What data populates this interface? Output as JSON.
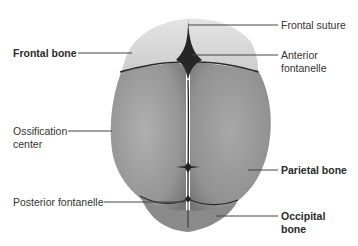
{
  "figure": {
    "labels": [
      {
        "id": "frontal-suture",
        "text": "Frontal suture",
        "bold": false
      },
      {
        "id": "frontal-bone",
        "text": "Frontal bone",
        "bold": true
      },
      {
        "id": "anterior-fontanelle-1",
        "text": "Anterior",
        "bold": false
      },
      {
        "id": "anterior-fontanelle-2",
        "text": "fontanelle",
        "bold": false
      },
      {
        "id": "ossification-center-1",
        "text": "Ossification",
        "bold": false
      },
      {
        "id": "ossification-center-2",
        "text": "center",
        "bold": false
      },
      {
        "id": "parietal-bone",
        "text": "Parietal bone",
        "bold": true
      },
      {
        "id": "posterior-fontanelle",
        "text": "Posterior fontanelle",
        "bold": false
      },
      {
        "id": "occipital-bone-1",
        "text": "Occipital",
        "bold": true
      },
      {
        "id": "occipital-bone-2",
        "text": "bone",
        "bold": true
      }
    ],
    "colors": {
      "frontal": "#d6d6d6",
      "parietal": "#9a9a9a",
      "occipital": "#7d7d7d",
      "fontanelle": "#262626",
      "leader": "#444444"
    }
  }
}
